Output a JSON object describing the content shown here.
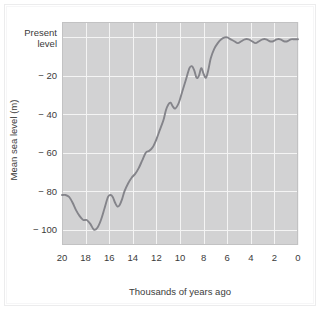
{
  "figure": {
    "background_color": "#ffffff",
    "plot_background_color": "#d2d2d3",
    "gridline_color": "#f4f4f4",
    "line_color": "#84848a"
  },
  "axes": {
    "x_axis_title": "Thousands of years ago",
    "y_axis_title": "Mean sea level (m)",
    "x_tick_labels": [
      "20",
      "18",
      "16",
      "14",
      "12",
      "10",
      "8",
      "6",
      "4",
      "2",
      "0"
    ],
    "y_tick_labels": [
      "Present level",
      "− 20",
      "− 40",
      "− 60",
      "− 80",
      "− 100"
    ],
    "y_tick_label_present_line1": "Present",
    "y_tick_label_present_line2": "level"
  },
  "chart_data": {
    "type": "line",
    "title": "",
    "subtitle": "",
    "xlabel": "Thousands of years ago",
    "ylabel": "Mean sea level (m)",
    "xlim": [
      20,
      0
    ],
    "ylim": [
      -108,
      8
    ],
    "x_reversed": true,
    "xticks": [
      20,
      18,
      16,
      14,
      12,
      10,
      8,
      6,
      4,
      2,
      0
    ],
    "yticks": [
      0,
      -20,
      -40,
      -60,
      -80,
      -100
    ],
    "ytick_text": [
      "Present level",
      "− 20",
      "− 40",
      "− 60",
      "− 80",
      "− 100"
    ],
    "grid": true,
    "legend": false,
    "series": [
      {
        "name": "Mean sea level",
        "x": [
          20.0,
          19.7,
          19.4,
          19.1,
          18.8,
          18.5,
          18.2,
          17.9,
          17.6,
          17.3,
          17.0,
          16.7,
          16.4,
          16.1,
          15.9,
          15.7,
          15.5,
          15.3,
          15.1,
          14.9,
          14.7,
          14.4,
          14.1,
          13.8,
          13.5,
          13.2,
          12.9,
          12.6,
          12.3,
          12.0,
          11.7,
          11.4,
          11.2,
          11.0,
          10.8,
          10.6,
          10.4,
          10.1,
          9.8,
          9.5,
          9.2,
          9.0,
          8.8,
          8.6,
          8.4,
          8.2,
          8.0,
          7.8,
          7.6,
          7.4,
          7.1,
          6.8,
          6.5,
          6.2,
          6.0,
          5.7,
          5.4,
          5.1,
          4.8,
          4.5,
          4.2,
          3.9,
          3.6,
          3.3,
          3.0,
          2.7,
          2.4,
          2.1,
          1.8,
          1.5,
          1.2,
          0.9,
          0.6,
          0.3,
          0.0
        ],
        "y": [
          -82,
          -82,
          -83,
          -86,
          -90,
          -93,
          -95,
          -95,
          -97,
          -100,
          -99,
          -95,
          -89,
          -83,
          -82,
          -83,
          -86,
          -88,
          -87,
          -84,
          -80,
          -76,
          -73,
          -71,
          -68,
          -64,
          -60,
          -59,
          -57,
          -53,
          -48,
          -43,
          -38,
          -35,
          -34,
          -36,
          -37,
          -34,
          -28,
          -22,
          -16,
          -15,
          -17,
          -21,
          -20,
          -16,
          -19,
          -21,
          -17,
          -11,
          -6,
          -3,
          -1,
          0,
          0,
          -1,
          -2,
          -3,
          -2,
          -1,
          -1,
          -2,
          -3,
          -2,
          -1,
          -1,
          -2,
          -2,
          -1,
          -1,
          -2,
          -2,
          -1,
          -1,
          -1
        ]
      }
    ]
  }
}
